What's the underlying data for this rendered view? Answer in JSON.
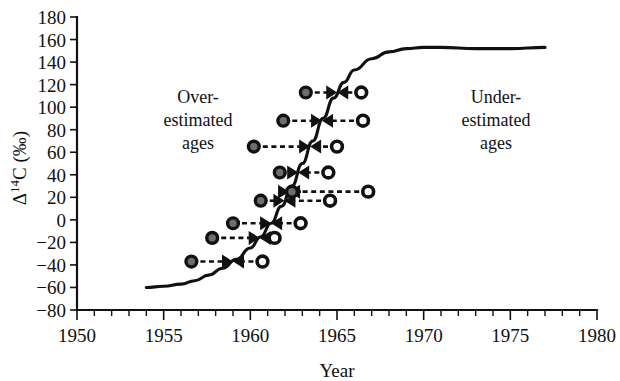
{
  "chart_data": {
    "type": "line",
    "title": "",
    "xlabel": "Year",
    "ylabel": "Δ¹⁴C (‰)",
    "ylabel_parts": {
      "delta": "Δ",
      "sup": "14",
      "rest": "C (‰)"
    },
    "xlim": [
      1950,
      1980
    ],
    "ylim": [
      -80,
      180
    ],
    "grid": false,
    "legend": "none",
    "x_ticks": [
      1950,
      1955,
      1960,
      1965,
      1970,
      1975,
      1980
    ],
    "x_tick_labels": [
      "1950",
      "1955",
      "1960",
      "1965",
      "1970",
      "1975",
      "1980"
    ],
    "x_minor_tick_step": 1,
    "y_ticks": [
      -80,
      -60,
      -40,
      -20,
      0,
      20,
      40,
      60,
      80,
      100,
      120,
      140,
      160,
      180
    ],
    "y_tick_labels": [
      "-80",
      "-60",
      "-40",
      "-20",
      "0",
      "20",
      "40",
      "60",
      "80",
      "100",
      "120",
      "140",
      "160",
      "180"
    ],
    "series": [
      {
        "name": "Atmospheric bomb curve",
        "type": "line",
        "x": [
          1954.0,
          1955.0,
          1956.0,
          1956.8,
          1957.6,
          1958.4,
          1959.2,
          1960.0,
          1960.6,
          1961.2,
          1961.8,
          1962.4,
          1963.0,
          1963.6,
          1964.2,
          1964.8,
          1965.4,
          1966.0,
          1967.0,
          1968.0,
          1969.0,
          1970.0,
          1971.0,
          1973.0,
          1975.0,
          1977.0
        ],
        "y": [
          -60,
          -59,
          -57,
          -54,
          -49,
          -43,
          -35,
          -25,
          -15,
          -3,
          12,
          30,
          50,
          70,
          90,
          108,
          122,
          133,
          143,
          149,
          152,
          153,
          153,
          152,
          152,
          153
        ]
      },
      {
        "name": "Measured sample pairs (ambiguous calendar ages)",
        "type": "scatter",
        "pairs": [
          {
            "label": "pair-1",
            "delta14c": 113,
            "filled_year": 1963.2,
            "open_year": 1966.4
          },
          {
            "label": "pair-2",
            "delta14c": 88,
            "filled_year": 1961.9,
            "open_year": 1966.5
          },
          {
            "label": "pair-3",
            "delta14c": 65,
            "filled_year": 1960.2,
            "open_year": 1965.0
          },
          {
            "label": "pair-4",
            "delta14c": 42,
            "filled_year": 1961.7,
            "open_year": 1964.5
          },
          {
            "label": "pair-5",
            "delta14c": 25,
            "filled_year": 1962.4,
            "open_year": 1966.8
          },
          {
            "label": "pair-6",
            "delta14c": 17,
            "filled_year": 1960.6,
            "open_year": 1964.6
          },
          {
            "label": "pair-7",
            "delta14c": -3,
            "filled_year": 1959.0,
            "open_year": 1962.9
          },
          {
            "label": "pair-8",
            "delta14c": -16,
            "filled_year": 1957.8,
            "open_year": 1961.4
          },
          {
            "label": "pair-9",
            "delta14c": -37,
            "filled_year": 1956.6,
            "open_year": 1960.7
          }
        ]
      }
    ],
    "annotations": [
      {
        "name": "over-estimated-ages",
        "lines": [
          "Over-",
          "estimated",
          "ages"
        ],
        "x": 1957.0,
        "y": 103
      },
      {
        "name": "under-estimated-ages",
        "lines": [
          "Under-",
          "estimated",
          "ages"
        ],
        "x": 1972.8,
        "y": 103
      }
    ],
    "markers": {
      "filled": {
        "fill": "#6e6e6e",
        "stroke": "#111111",
        "meaning": "earlier calendar age (rising limb)"
      },
      "open": {
        "fill": "#ffffff",
        "stroke": "#111111",
        "meaning": "later calendar age (falling limb)"
      },
      "connector": {
        "style": "dashed",
        "arrow": "toward curve",
        "color": "#111111"
      }
    }
  }
}
